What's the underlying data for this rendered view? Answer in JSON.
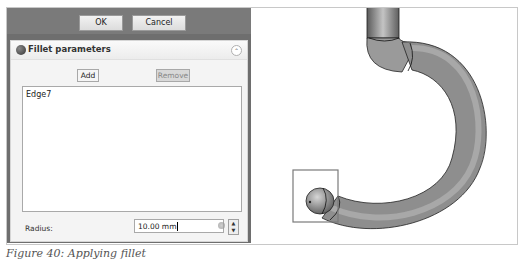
{
  "dialog": {
    "ok_label": "OK",
    "cancel_label": "Cancel"
  },
  "task_panel": {
    "title": "Fillet parameters",
    "icon": "fillet-gear-icon",
    "collapse_icon": "double-chevron-up-icon",
    "add_label": "Add",
    "remove_label": "Remove",
    "edges": [
      "Edge7"
    ],
    "radius_label": "Radius:",
    "radius_value": "10.00 mm",
    "spin_up": "▲",
    "spin_down": "▼",
    "collapse_glyph": "⌃"
  },
  "viewport": {
    "object": "curved hook-shaped pipe with filleted end",
    "selection_box": "selected edge highlight"
  },
  "caption": {
    "text": "Figure 40: Applying fillet"
  }
}
